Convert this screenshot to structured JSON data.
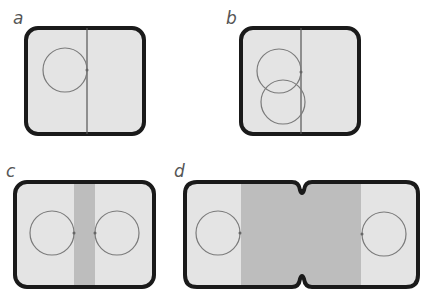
{
  "panels": [
    {
      "label": "a",
      "description": "cell with one circle near dividing line"
    },
    {
      "label": "b",
      "description": "cell with two overlapping circles near dividing line"
    },
    {
      "label": "c",
      "description": "cell split by shaded band, two circles facing band"
    },
    {
      "label": "d",
      "description": "elongated pinched cell with wide shaded band, two circles at ends"
    }
  ],
  "colors": {
    "cell_fill": "#e4e4e4",
    "band_fill": "#bdbdbd",
    "outline": "#1a1a1a",
    "circle": "#7a7a7a"
  }
}
